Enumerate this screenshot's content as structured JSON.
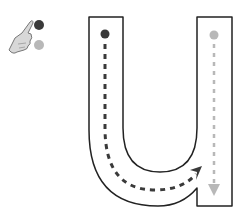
{
  "worksheet": {
    "letter": "u",
    "case": "lowercase",
    "legend": {
      "icon": "pointing-hand-icon",
      "first_stroke_color": "#3a3a3a",
      "second_stroke_color": "#b8b8b8"
    },
    "strokes": [
      {
        "order": 1,
        "color": "#3a3a3a",
        "description": "down the left side and curve up to the right"
      },
      {
        "order": 2,
        "color": "#b8b8b8",
        "description": "straight down on the right"
      }
    ],
    "outline_color": "#222222"
  }
}
